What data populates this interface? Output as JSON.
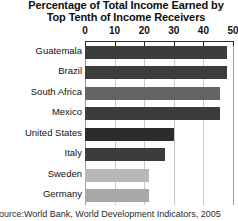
{
  "chart_data": {
    "type": "bar",
    "orientation": "horizontal",
    "title": "Percentage of Total Income Earned by Top Tenth of Income Receivers",
    "title_line1": "Percentage of Total Income Earned by",
    "title_line2": "Top Tenth of Income Receivers",
    "xlabel": "",
    "ylabel": "",
    "xlim": [
      0,
      50
    ],
    "ticks": [
      0,
      10,
      20,
      30,
      40,
      50
    ],
    "tick_labels": [
      "0",
      "10",
      "20",
      "30",
      "40",
      "50"
    ],
    "grid": true,
    "legend": "none",
    "categories": [
      "Guatemala",
      "Brazil",
      "South Africa",
      "Mexico",
      "United States",
      "Italy",
      "Sweden",
      "Germany"
    ],
    "values": [
      48,
      48,
      45.5,
      45.5,
      30,
      27,
      21.5,
      21.5
    ],
    "bar_colors": [
      "#3c3c3c",
      "#3c3c3c",
      "#636363",
      "#3c3c3c",
      "#2b2b2b",
      "#3c3c3c",
      "#b8b8b8",
      "#a8a8a8"
    ],
    "source": "Source:World Bank, World Development Indicators, 2005"
  },
  "colors": {
    "bar_dark": "#3c3c3c",
    "bar_light": "#b8b8b8",
    "axis": "#2b2b2b",
    "gridline": "#c9c9c9",
    "background": "#ffffff"
  }
}
